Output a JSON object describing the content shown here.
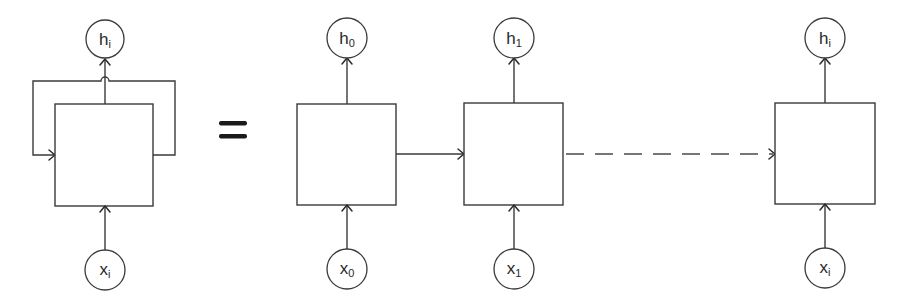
{
  "diagram": {
    "equals_symbol": "=",
    "colors": {
      "stroke": "#3a3a3a",
      "background": "#ffffff",
      "text": "#2a2a2a"
    },
    "folded": {
      "output": {
        "base": "h",
        "sub": "i"
      },
      "input": {
        "base": "x",
        "sub": "i"
      }
    },
    "unrolled": [
      {
        "output": {
          "base": "h",
          "sub": "0"
        },
        "input": {
          "base": "x",
          "sub": "0"
        }
      },
      {
        "output": {
          "base": "h",
          "sub": "1"
        },
        "input": {
          "base": "x",
          "sub": "1"
        }
      },
      {
        "output": {
          "base": "h",
          "sub": "i"
        },
        "input": {
          "base": "x",
          "sub": "i"
        }
      }
    ]
  }
}
